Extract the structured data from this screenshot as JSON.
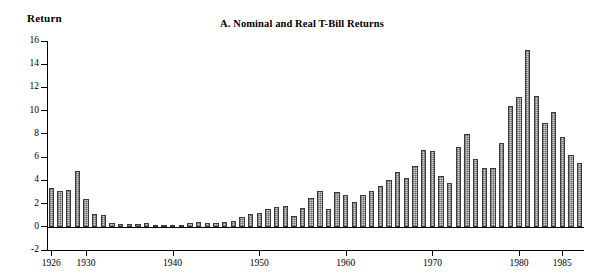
{
  "figure": {
    "panel_label": "A.",
    "title": "A.  Nominal and Real T-Bill Returns",
    "y_axis_title": "Return"
  },
  "chart_data": {
    "type": "bar",
    "title": "A.  Nominal and Real T-Bill Returns",
    "xlabel": "",
    "ylabel": "Return",
    "ylim": [
      -2,
      16
    ],
    "ytick_values": [
      -2,
      0,
      2,
      4,
      6,
      8,
      10,
      12,
      14,
      16
    ],
    "ytick_labels": [
      "-2",
      "0",
      "2",
      "4",
      "6",
      "8",
      "10",
      "12",
      "14",
      "16"
    ],
    "xlim": [
      1925.5,
      1987.5
    ],
    "xtick_values": [
      1926,
      1930,
      1940,
      1950,
      1960,
      1970,
      1980,
      1985
    ],
    "xtick_labels": [
      "1926",
      "1930",
      "1940",
      "1950",
      "1960",
      "1970",
      "1980",
      "1985"
    ],
    "grid": false,
    "legend": null,
    "bar_fill": "#d6d6d6",
    "bar_edge": "#3a3a3a",
    "series_name": "Nominal T-Bill Return",
    "categories": [
      1926,
      1927,
      1928,
      1929,
      1930,
      1931,
      1932,
      1933,
      1934,
      1935,
      1936,
      1937,
      1938,
      1939,
      1940,
      1941,
      1942,
      1943,
      1944,
      1945,
      1946,
      1947,
      1948,
      1949,
      1950,
      1951,
      1952,
      1953,
      1954,
      1955,
      1956,
      1957,
      1958,
      1959,
      1960,
      1961,
      1962,
      1963,
      1964,
      1965,
      1966,
      1967,
      1968,
      1969,
      1970,
      1971,
      1972,
      1973,
      1974,
      1975,
      1976,
      1977,
      1978,
      1979,
      1980,
      1981,
      1982,
      1983,
      1984,
      1985,
      1986,
      1987
    ],
    "values": [
      3.3,
      3.1,
      3.2,
      4.8,
      2.4,
      1.1,
      1.0,
      0.3,
      0.2,
      0.2,
      0.2,
      0.3,
      0.0,
      0.0,
      0.0,
      0.1,
      0.3,
      0.4,
      0.3,
      0.3,
      0.4,
      0.5,
      0.8,
      1.1,
      1.2,
      1.5,
      1.7,
      1.8,
      0.9,
      1.6,
      2.5,
      3.1,
      1.5,
      3.0,
      2.7,
      2.1,
      2.7,
      3.1,
      3.5,
      4.0,
      4.7,
      4.2,
      5.2,
      6.6,
      6.5,
      4.4,
      3.8,
      6.9,
      8.0,
      5.8,
      5.1,
      5.1,
      7.2,
      10.4,
      11.2,
      15.2,
      11.3,
      8.9,
      9.9,
      7.7,
      6.2,
      5.5
    ]
  }
}
